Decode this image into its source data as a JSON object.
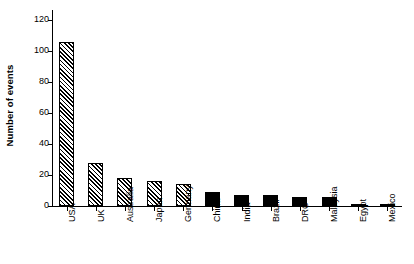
{
  "chart_data": {
    "type": "bar",
    "title": "",
    "subtitle": "",
    "xlabel": "",
    "ylabel": "Number of events",
    "ylim": [
      0,
      120
    ],
    "yticks": [
      0,
      20,
      40,
      60,
      80,
      100,
      120
    ],
    "ytick_labels": [
      "0",
      "20",
      "40",
      "60",
      "80",
      "100",
      "120"
    ],
    "grid": false,
    "legend": null,
    "categories": [
      "USA",
      "UK",
      "Australia",
      "Japan",
      "Germany",
      "China",
      "India",
      "Brazil",
      "DRC",
      "Malaysia",
      "Egypt",
      "Mexico"
    ],
    "values": [
      106,
      28,
      18,
      16,
      14,
      9,
      7,
      7,
      6,
      6,
      1,
      1
    ],
    "bar_styles": [
      "hatched",
      "hatched",
      "hatched",
      "hatched",
      "hatched",
      "solid",
      "solid",
      "solid",
      "solid",
      "solid",
      "solid",
      "solid"
    ],
    "series": [
      {
        "name": "Number of events",
        "values": [
          106,
          28,
          18,
          16,
          14,
          9,
          7,
          7,
          6,
          6,
          1,
          1
        ]
      }
    ]
  },
  "axes": {
    "y_title": "Number of events"
  }
}
